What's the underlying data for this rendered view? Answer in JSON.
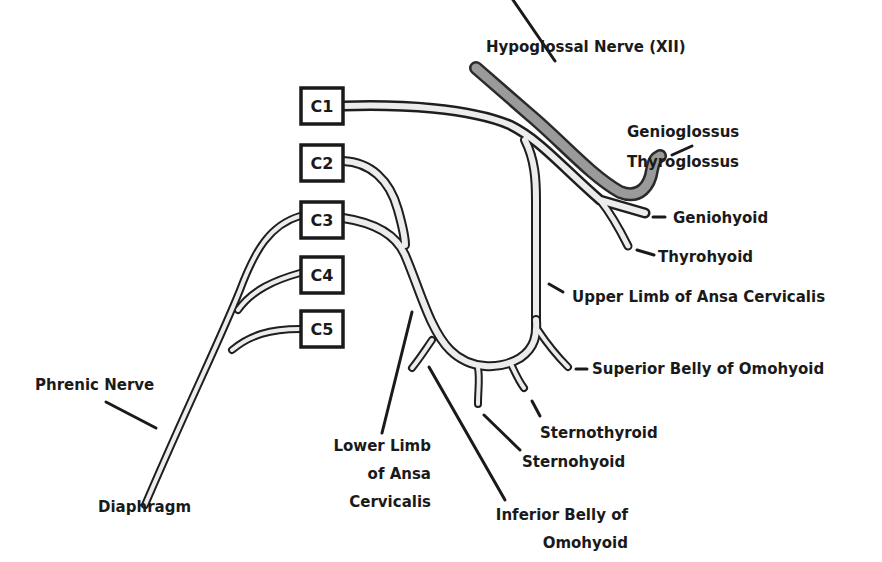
{
  "diagram": {
    "colors": {
      "nerve_fill": "#ececec",
      "nerve_outline": "#1e1e1e",
      "hypoglossal_fill": "#9a9a9a",
      "text": "#1a1a1a",
      "background": "#ffffff"
    },
    "roots": [
      {
        "id": "C1",
        "label": "C1"
      },
      {
        "id": "C2",
        "label": "C2"
      },
      {
        "id": "C3",
        "label": "C3"
      },
      {
        "id": "C4",
        "label": "C4"
      },
      {
        "id": "C5",
        "label": "C5"
      }
    ],
    "labels": {
      "hypoglossal": "Hypoglossal Nerve (XII)",
      "genioglossus": "Genioglossus",
      "thyroglossus": "Thyroglossus",
      "geniohyoid": "Geniohyoid",
      "thyrohyoid": "Thyrohyoid",
      "upper_limb": "Upper Limb of Ansa Cervicalis",
      "superior_belly": "Superior Belly of Omohyoid",
      "sternothyroid": "Sternothyroid",
      "sternohyoid": "Sternohyoid",
      "lower_limb_1": "Lower Limb",
      "lower_limb_2": "of Ansa",
      "lower_limb_3": "Cervicalis",
      "inferior_belly_1": "Inferior Belly of",
      "inferior_belly_2": "Omohyoid",
      "phrenic": "Phrenic Nerve",
      "diaphragm": "Diaphragm"
    }
  }
}
